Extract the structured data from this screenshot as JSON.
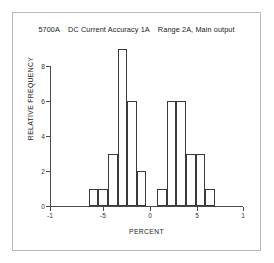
{
  "figure": {
    "title": "5700A    DC Current Accuracy 1A    Range 2A, Main output",
    "background_color": "#ffffff",
    "frame_color": "#b8b8b8",
    "axis_color": "#4a4a4a",
    "bar_edge_color": "#3a3a3a"
  },
  "chart_data": {
    "type": "bar",
    "title": "5700A    DC Current Accuracy 1A    Range 2A, Main output",
    "xlabel": "PERCENT",
    "ylabel": "RELATIVE FREQUENCY",
    "xlim": [
      -1,
      1
    ],
    "ylim": [
      0,
      9
    ],
    "grid": false,
    "legend": null,
    "xticks": [
      -1,
      -5,
      0,
      5,
      1
    ],
    "xticklabels": [
      "-1",
      "-5",
      "0",
      "5",
      "1"
    ],
    "xtick_positions_px": [
      50,
      103,
      150,
      197,
      243
    ],
    "yticks": [
      0,
      2,
      4,
      6,
      8
    ],
    "yticklabels": [
      "0",
      "2",
      "4",
      "6",
      "8"
    ],
    "bin_edges": [
      -0.6,
      -0.5,
      -0.4,
      -0.3,
      -0.2,
      -0.1,
      0.0,
      0.11,
      0.21,
      0.31,
      0.41,
      0.51,
      0.61
    ],
    "bars": [
      {
        "left": -0.6,
        "right": -0.5,
        "value": 1
      },
      {
        "left": -0.5,
        "right": -0.4,
        "value": 1
      },
      {
        "left": -0.4,
        "right": -0.3,
        "value": 3
      },
      {
        "left": -0.3,
        "right": -0.2,
        "value": 9
      },
      {
        "left": -0.2,
        "right": -0.1,
        "value": 6
      },
      {
        "left": -0.1,
        "right": 0.0,
        "value": 2
      },
      {
        "left": 0.11,
        "right": 0.21,
        "value": 1
      },
      {
        "left": 0.21,
        "right": 0.31,
        "value": 6
      },
      {
        "left": 0.31,
        "right": 0.41,
        "value": 6
      },
      {
        "left": 0.41,
        "right": 0.51,
        "value": 3
      },
      {
        "left": 0.51,
        "right": 0.61,
        "value": 3
      },
      {
        "left": 0.61,
        "right": 0.71,
        "value": 1
      }
    ],
    "values": [
      1,
      1,
      3,
      9,
      6,
      2,
      1,
      6,
      6,
      3,
      3,
      1
    ]
  }
}
